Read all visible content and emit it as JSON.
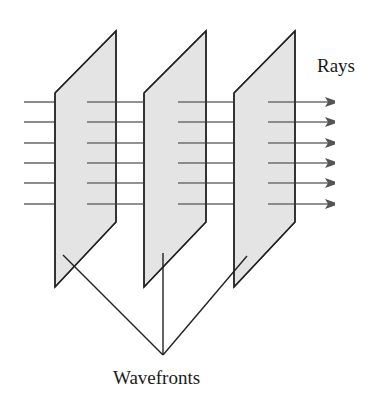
{
  "diagram": {
    "type": "plane-wave-illustration",
    "labels": {
      "rays": "Rays",
      "wavefronts": "Wavefronts"
    },
    "colors": {
      "panel_fill": "#e4e4e4",
      "panel_stroke": "#222222",
      "ray_stroke": "#6e6e6e",
      "pointer_stroke": "#222222"
    },
    "wavefronts": [
      {
        "id": "wavefront-1",
        "points": [
          [
            55,
            93
          ],
          [
            116,
            31
          ],
          [
            116,
            222
          ],
          [
            55,
            287
          ]
        ]
      },
      {
        "id": "wavefront-2",
        "points": [
          [
            144,
            93
          ],
          [
            206,
            31
          ],
          [
            206,
            222
          ],
          [
            144,
            287
          ]
        ]
      },
      {
        "id": "wavefront-3",
        "points": [
          [
            234,
            93
          ],
          [
            295,
            31
          ],
          [
            295,
            222
          ],
          [
            234,
            287
          ]
        ]
      }
    ],
    "ray_y": [
      102,
      122,
      143,
      163,
      183,
      204
    ],
    "ray_segments": [
      {
        "x1": 24,
        "x2": 55
      },
      {
        "x1": 87,
        "x2": 144
      },
      {
        "x1": 178,
        "x2": 234
      },
      {
        "x1": 268,
        "x2": 346,
        "arrow": true
      }
    ],
    "pointer_lines": {
      "apex": [
        163,
        355
      ],
      "ends": [
        [
          63,
          255
        ],
        [
          163,
          253
        ],
        [
          247,
          256
        ]
      ]
    }
  }
}
